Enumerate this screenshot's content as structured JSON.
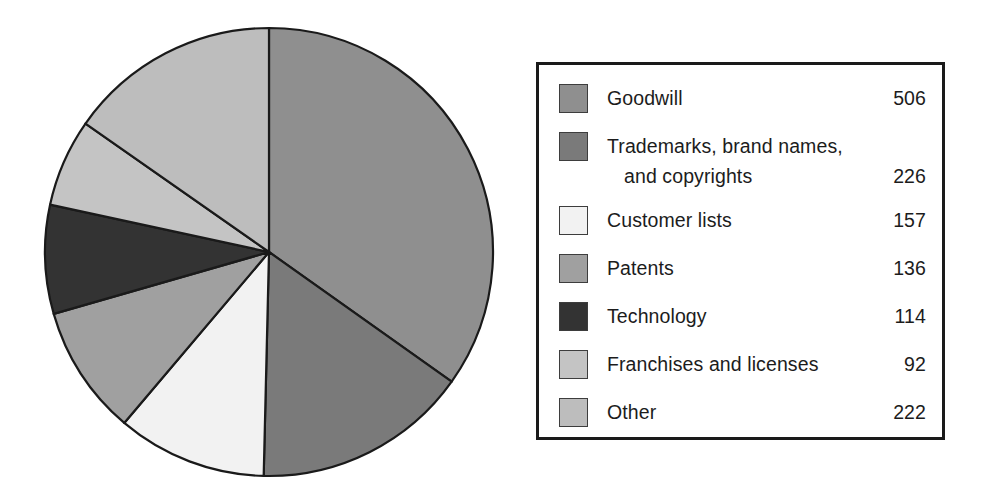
{
  "chart_data": {
    "type": "pie",
    "title": "",
    "subtitle": "",
    "xlabel": "",
    "ylabel": "",
    "legend_position": "right",
    "grid": false,
    "total": 1453,
    "start_angle_deg": 0,
    "direction": "clockwise",
    "categories": [
      "Goodwill",
      "Trademarks, brand names, and copyrights",
      "Customer lists",
      "Patents",
      "Technology",
      "Franchises and licenses",
      "Other"
    ],
    "values": [
      506,
      226,
      157,
      136,
      114,
      92,
      222
    ],
    "colors": [
      "#8f8f8f",
      "#7a7a7a",
      "#f2f2f2",
      "#a0a0a0",
      "#333333",
      "#c4c4c4",
      "#bdbdbd"
    ],
    "slices": [
      {
        "label": "Goodwill",
        "value": 506,
        "color": "#8f8f8f"
      },
      {
        "label": "Trademarks, brand names, and copyrights",
        "value": 226,
        "color": "#7a7a7a"
      },
      {
        "label": "Customer lists",
        "value": 157,
        "color": "#f2f2f2"
      },
      {
        "label": "Patents",
        "value": 136,
        "color": "#a0a0a0"
      },
      {
        "label": "Technology",
        "value": 114,
        "color": "#333333"
      },
      {
        "label": "Franchises and licenses",
        "value": 92,
        "color": "#c4c4c4"
      },
      {
        "label": "Other",
        "value": 222,
        "color": "#bdbdbd"
      }
    ],
    "geometry": {
      "center_x": 269,
      "center_y": 252,
      "radius": 224
    }
  },
  "legend": {
    "border_color": "#1a1a1a",
    "items": [
      {
        "label": "Goodwill",
        "label_line2": "",
        "value": "506",
        "color": "#8f8f8f"
      },
      {
        "label": "Trademarks, brand names,",
        "label_line2": "and copyrights",
        "value": "226",
        "color": "#7a7a7a"
      },
      {
        "label": "Customer lists",
        "label_line2": "",
        "value": "157",
        "color": "#f2f2f2"
      },
      {
        "label": "Patents",
        "label_line2": "",
        "value": "136",
        "color": "#a0a0a0"
      },
      {
        "label": "Technology",
        "label_line2": "",
        "value": "114",
        "color": "#333333"
      },
      {
        "label": "Franchises and licenses",
        "label_line2": "",
        "value": "92",
        "color": "#c4c4c4"
      },
      {
        "label": "Other",
        "label_line2": "",
        "value": "222",
        "color": "#bdbdbd"
      }
    ]
  }
}
